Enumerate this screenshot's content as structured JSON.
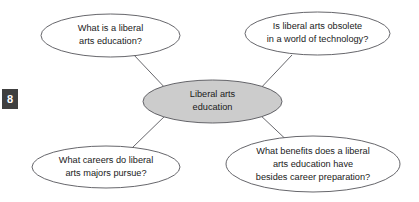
{
  "page": {
    "page_number_badge": "8",
    "background_color": "#ffffff"
  },
  "diagram": {
    "type": "cluster-web-diagram",
    "line_color": "#55555a",
    "center_fill_color": "#cccccc",
    "node_fill_color": "#ffffff",
    "center_node": {
      "name": "liberal-arts-education",
      "lines": [
        "Liberal arts",
        "education"
      ],
      "full_text": "Liberal arts education"
    },
    "branch_nodes": [
      {
        "name": "what-is-a-liberal-arts-education",
        "position": "top-left",
        "lines": [
          "What is a liberal",
          "arts education?"
        ],
        "full_text": "What is a liberal arts education?"
      },
      {
        "name": "is-liberal-arts-obsolete",
        "position": "top-right",
        "lines": [
          "Is liberal arts obsolete",
          "in a world of technology?"
        ],
        "full_text": "Is liberal arts obsolete in a world of technology?"
      },
      {
        "name": "what-careers-do-liberal-arts-majors-pursue",
        "position": "bottom-left",
        "lines": [
          "What careers do liberal",
          "arts majors pursue?"
        ],
        "full_text": "What careers do liberal arts majors pursue?"
      },
      {
        "name": "what-benefits-besides-career-preparation",
        "position": "bottom-right",
        "lines": [
          "What benefits does a liberal",
          "arts education have",
          "besides career preparation?"
        ],
        "full_text": "What benefits does a liberal arts education have besides career preparation?"
      }
    ]
  }
}
